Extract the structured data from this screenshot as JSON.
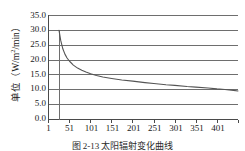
{
  "figure": {
    "caption": "图 2-13  太阳辐射变化曲线",
    "background_color": "#ffffff",
    "grid_color": "#6e6e6e",
    "axis_color": "#4a4a4a",
    "curve_color": "#555555"
  },
  "axes": {
    "y_label": "单位（W/m",
    "y_label_sup": "2",
    "y_label_tail": "/min）",
    "y_label_full": "单位（W/m²/min）",
    "y_ticks": [
      "0.0",
      "5.0",
      "10.0",
      "15.0",
      "20.0",
      "25.0",
      "30.0",
      "35.0"
    ],
    "x_ticks": [
      "1",
      "51",
      "101",
      "151",
      "201",
      "251",
      "301",
      "351",
      "401"
    ]
  },
  "chart_data": {
    "type": "line",
    "title": "",
    "xlabel": "",
    "ylabel": "单位（W/m²/min）",
    "xlim": [
      1,
      451
    ],
    "ylim": [
      0.0,
      35.0
    ],
    "ytick_values": [
      0.0,
      5.0,
      10.0,
      15.0,
      20.0,
      25.0,
      30.0,
      35.0
    ],
    "xtick_values": [
      1,
      51,
      101,
      151,
      201,
      251,
      301,
      351,
      401
    ],
    "grid": true,
    "grid_axis": "y",
    "legend": false,
    "series": [
      {
        "name": "辐射强度",
        "x": [
          26,
          30,
          35,
          40,
          45,
          51,
          60,
          70,
          80,
          90,
          101,
          115,
          130,
          151,
          175,
          201,
          230,
          251,
          280,
          301,
          330,
          351,
          380,
          401,
          420,
          440,
          451
        ],
        "values": [
          30.0,
          26.6,
          23.8,
          22.0,
          20.7,
          19.6,
          18.3,
          17.3,
          16.6,
          16.0,
          15.4,
          14.8,
          14.3,
          13.8,
          13.3,
          12.9,
          12.4,
          12.1,
          11.7,
          11.5,
          11.1,
          10.9,
          10.6,
          10.3,
          10.1,
          9.8,
          9.6
        ]
      }
    ],
    "annotations": [
      {
        "type": "vertical-line",
        "x": 26,
        "y_from": 0.0,
        "y_to": 30.0
      }
    ]
  }
}
